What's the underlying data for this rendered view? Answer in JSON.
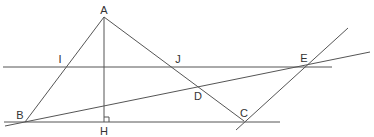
{
  "diagram": {
    "type": "geometry",
    "stroke_color": "#555555",
    "label_color": "#333333",
    "points": {
      "A": {
        "label": "A",
        "x": 104,
        "y": 17,
        "lx": 104,
        "ly": 10
      },
      "B": {
        "label": "B",
        "x": 25,
        "y": 122,
        "lx": 20,
        "ly": 115
      },
      "C": {
        "label": "C",
        "x": 244,
        "y": 121,
        "lx": 244,
        "ly": 113
      },
      "D": {
        "label": "D",
        "x": 199,
        "y": 87,
        "lx": 198,
        "ly": 96
      },
      "E": {
        "label": "E",
        "x": 305,
        "y": 66,
        "lx": 304,
        "ly": 58
      },
      "H": {
        "label": "H",
        "x": 104,
        "y": 122,
        "lx": 104,
        "ly": 131
      },
      "I": {
        "label": "I",
        "x": 64,
        "y": 67,
        "lx": 60,
        "ly": 59
      },
      "J": {
        "label": "J",
        "x": 173,
        "y": 67,
        "lx": 178,
        "ly": 59
      }
    },
    "segments": [
      {
        "name": "segment-AB",
        "from": "A",
        "to": "B"
      },
      {
        "name": "segment-AC",
        "from": "A",
        "to": "C"
      },
      {
        "name": "altitude-AH",
        "from": "A",
        "to": "H"
      }
    ],
    "lines": [
      {
        "name": "line-IJ-parallel",
        "x1": 3,
        "y1": 67,
        "x2": 332,
        "y2": 67
      },
      {
        "name": "line-BC-base",
        "x1": 4,
        "y1": 122,
        "x2": 280,
        "y2": 122
      },
      {
        "name": "line-BDE",
        "x1": 5,
        "y1": 126,
        "x2": 370,
        "y2": 52
      },
      {
        "name": "line-CE",
        "x1": 236,
        "y1": 130,
        "x2": 348,
        "y2": 28
      }
    ],
    "right_angle_marker": {
      "at": "H",
      "size": 5
    }
  }
}
